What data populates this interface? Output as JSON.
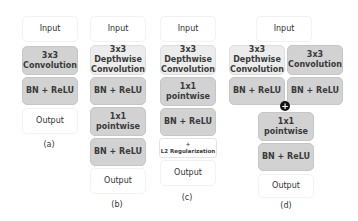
{
  "diagrams": {
    "a": {
      "caption": "(a)",
      "blocks": [
        "Input",
        "3x3\nConvolution",
        "BN + ReLU",
        "Output"
      ]
    },
    "b": {
      "caption": "(b)",
      "blocks": [
        "Input",
        "3x3\nDepthwise\nConvolution",
        "BN + ReLU",
        "1x1\npointwise",
        "BN + ReLU",
        "Output"
      ]
    },
    "c": {
      "caption": "(c)",
      "blocks": [
        "Input",
        "3x3\nDepthwise\nConvolution",
        "1x1\npointwise",
        "BN + ReLU",
        "+\nL2 Regularization",
        "Output"
      ]
    },
    "d": {
      "caption": "(d)",
      "blocks": [
        "Input",
        "3x3\nDepthwise\nConvolution",
        "3x3\nConvolution",
        "BN + ReLU",
        "BN + ReLU",
        "1x1\npointwise",
        "BN + ReLU",
        "Output"
      ],
      "merge_symbol": "+"
    }
  }
}
